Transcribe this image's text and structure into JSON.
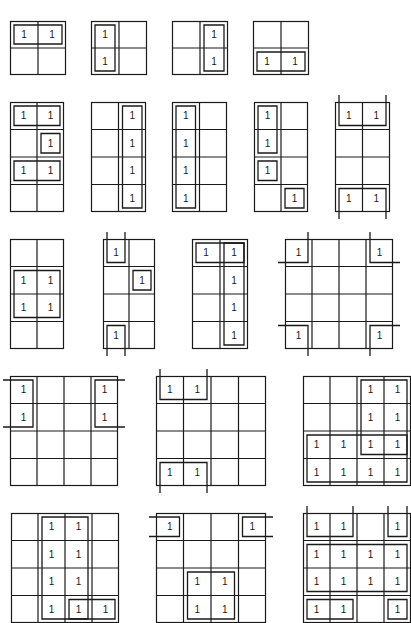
{
  "figure": {
    "cell_value_symbol": "1",
    "line_color": "#1a1a1a"
  },
  "maps": [
    {
      "id": "m1",
      "x": 10,
      "y": 21,
      "cols": 2,
      "rows": 2,
      "cw": 28,
      "ch": 27,
      "ones": [
        [
          0,
          0
        ],
        [
          0,
          1
        ]
      ],
      "loops": [
        {
          "type": "rect",
          "r0": 0,
          "c0": 0,
          "r1": 0,
          "c1": 1
        }
      ]
    },
    {
      "id": "m2",
      "x": 91,
      "y": 21,
      "cols": 2,
      "rows": 2,
      "cw": 28,
      "ch": 27,
      "ones": [
        [
          0,
          0
        ],
        [
          1,
          0
        ]
      ],
      "loops": [
        {
          "type": "rect",
          "r0": 0,
          "c0": 0,
          "r1": 1,
          "c1": 0
        }
      ]
    },
    {
      "id": "m3",
      "x": 172,
      "y": 21,
      "cols": 2,
      "rows": 2,
      "cw": 28,
      "ch": 27,
      "ones": [
        [
          0,
          1
        ],
        [
          1,
          1
        ]
      ],
      "loops": [
        {
          "type": "rect",
          "r0": 0,
          "c0": 1,
          "r1": 1,
          "c1": 1
        }
      ]
    },
    {
      "id": "m4",
      "x": 253,
      "y": 21,
      "cols": 2,
      "rows": 2,
      "cw": 28,
      "ch": 27,
      "ones": [
        [
          1,
          0
        ],
        [
          1,
          1
        ]
      ],
      "loops": [
        {
          "type": "rect",
          "r0": 1,
          "c0": 0,
          "r1": 1,
          "c1": 1
        }
      ]
    },
    {
      "id": "m5",
      "x": 10,
      "y": 102,
      "cols": 2,
      "rows": 4,
      "cw": 27,
      "ch": 27.5,
      "ones": [
        [
          0,
          0
        ],
        [
          0,
          1
        ],
        [
          1,
          1
        ],
        [
          2,
          0
        ],
        [
          2,
          1
        ]
      ],
      "loops": [
        {
          "type": "rect",
          "r0": 0,
          "c0": 0,
          "r1": 0,
          "c1": 1
        },
        {
          "type": "rect",
          "r0": 1,
          "c0": 1,
          "r1": 1,
          "c1": 1
        },
        {
          "type": "rect",
          "r0": 2,
          "c0": 0,
          "r1": 2,
          "c1": 1
        }
      ]
    },
    {
      "id": "m6",
      "x": 91,
      "y": 102,
      "cols": 2,
      "rows": 4,
      "cw": 27.5,
      "ch": 27.5,
      "ones": [
        [
          0,
          1
        ],
        [
          1,
          1
        ],
        [
          2,
          1
        ],
        [
          3,
          1
        ]
      ],
      "loops": [
        {
          "type": "rect",
          "r0": 0,
          "c0": 1,
          "r1": 3,
          "c1": 1
        }
      ]
    },
    {
      "id": "m7",
      "x": 172,
      "y": 102,
      "cols": 2,
      "rows": 4,
      "cw": 27.5,
      "ch": 27.5,
      "ones": [
        [
          0,
          0
        ],
        [
          1,
          0
        ],
        [
          2,
          0
        ],
        [
          3,
          0
        ]
      ],
      "loops": [
        {
          "type": "rect",
          "r0": 0,
          "c0": 0,
          "r1": 3,
          "c1": 0
        }
      ]
    },
    {
      "id": "m8",
      "x": 254,
      "y": 102,
      "cols": 2,
      "rows": 4,
      "cw": 27,
      "ch": 27.5,
      "ones": [
        [
          0,
          0
        ],
        [
          1,
          0
        ],
        [
          2,
          0
        ],
        [
          3,
          1
        ]
      ],
      "loops": [
        {
          "type": "rect",
          "r0": 0,
          "c0": 0,
          "r1": 1,
          "c1": 0
        },
        {
          "type": "rect",
          "r0": 2,
          "c0": 0,
          "r1": 2,
          "c1": 0
        },
        {
          "type": "rect",
          "r0": 3,
          "c0": 1,
          "r1": 3,
          "c1": 1
        }
      ]
    },
    {
      "id": "m9",
      "x": 335,
      "y": 102,
      "cols": 2,
      "rows": 4,
      "cw": 27.5,
      "ch": 27.5,
      "ones": [
        [
          0,
          0
        ],
        [
          0,
          1
        ],
        [
          3,
          0
        ],
        [
          3,
          1
        ]
      ],
      "loops": [
        {
          "type": "open-top-down",
          "r0": 0,
          "c0": 0,
          "r1": 0,
          "c1": 1
        },
        {
          "type": "open-bottom-up",
          "r0": 3,
          "c0": 0,
          "r1": 3,
          "c1": 1
        }
      ]
    },
    {
      "id": "m10",
      "x": 10,
      "y": 239,
      "cols": 2,
      "rows": 4,
      "cw": 27,
      "ch": 27.5,
      "ones": [
        [
          1,
          0
        ],
        [
          1,
          1
        ],
        [
          2,
          0
        ],
        [
          2,
          1
        ]
      ],
      "loops": [
        {
          "type": "rect",
          "r0": 1,
          "c0": 0,
          "r1": 2,
          "c1": 1
        }
      ]
    },
    {
      "id": "m11",
      "x": 103,
      "y": 239,
      "cols": 2,
      "rows": 4,
      "cw": 26,
      "ch": 27.5,
      "ones": [
        [
          0,
          0
        ],
        [
          1,
          1
        ],
        [
          3,
          0
        ]
      ],
      "loops": [
        {
          "type": "open-top-down",
          "r0": 0,
          "c0": 0,
          "r1": 0,
          "c1": 0
        },
        {
          "type": "rect",
          "r0": 1,
          "c0": 1,
          "r1": 1,
          "c1": 1
        },
        {
          "type": "open-bottom-up",
          "r0": 3,
          "c0": 0,
          "r1": 3,
          "c1": 0
        }
      ]
    },
    {
      "id": "m12",
      "x": 192,
      "y": 239,
      "cols": 2,
      "rows": 4,
      "cw": 28,
      "ch": 27.5,
      "ones": [
        [
          0,
          0
        ],
        [
          0,
          1
        ],
        [
          1,
          1
        ],
        [
          2,
          1
        ],
        [
          3,
          1
        ]
      ],
      "loops": [
        {
          "type": "rect",
          "r0": 0,
          "c0": 0,
          "r1": 0,
          "c1": 1
        },
        {
          "type": "rect",
          "r0": 0,
          "c0": 1,
          "r1": 3,
          "c1": 1
        }
      ]
    },
    {
      "id": "m13",
      "x": 285,
      "y": 239,
      "cols": 4,
      "rows": 4,
      "cw": 27,
      "ch": 27.5,
      "ones": [
        [
          0,
          0
        ],
        [
          0,
          3
        ],
        [
          3,
          0
        ],
        [
          3,
          3
        ]
      ],
      "loops": [
        {
          "type": "corner",
          "r": 0,
          "c": 0
        },
        {
          "type": "corner",
          "r": 0,
          "c": 3
        },
        {
          "type": "corner",
          "r": 3,
          "c": 0
        },
        {
          "type": "corner",
          "r": 3,
          "c": 3
        }
      ]
    },
    {
      "id": "m14",
      "x": 10,
      "y": 376,
      "cols": 4,
      "rows": 4,
      "cw": 27,
      "ch": 27.5,
      "ones": [
        [
          0,
          0
        ],
        [
          1,
          0
        ],
        [
          0,
          3
        ],
        [
          1,
          3
        ]
      ],
      "loops": [
        {
          "type": "open-left-right",
          "r0": 0,
          "c0": 0,
          "r1": 1,
          "c1": 0
        },
        {
          "type": "open-right-left",
          "r0": 0,
          "c0": 3,
          "r1": 1,
          "c1": 3
        }
      ]
    },
    {
      "id": "m15",
      "x": 156,
      "y": 376,
      "cols": 4,
      "rows": 4,
      "cw": 27.5,
      "ch": 27.5,
      "ones": [
        [
          0,
          0
        ],
        [
          0,
          1
        ],
        [
          3,
          0
        ],
        [
          3,
          1
        ]
      ],
      "loops": [
        {
          "type": "open-top-down",
          "r0": 0,
          "c0": 0,
          "r1": 0,
          "c1": 1
        },
        {
          "type": "open-bottom-up",
          "r0": 3,
          "c0": 0,
          "r1": 3,
          "c1": 1
        }
      ]
    },
    {
      "id": "m16",
      "x": 303,
      "y": 376,
      "cols": 4,
      "rows": 4,
      "cw": 27,
      "ch": 27.5,
      "ones": [
        [
          0,
          2
        ],
        [
          0,
          3
        ],
        [
          1,
          2
        ],
        [
          1,
          3
        ],
        [
          2,
          0
        ],
        [
          2,
          1
        ],
        [
          2,
          2
        ],
        [
          2,
          3
        ],
        [
          3,
          0
        ],
        [
          3,
          1
        ],
        [
          3,
          2
        ],
        [
          3,
          3
        ]
      ],
      "loops": [
        {
          "type": "rect",
          "r0": 0,
          "c0": 2,
          "r1": 2,
          "c1": 3
        },
        {
          "type": "rect",
          "r0": 2,
          "c0": 0,
          "r1": 3,
          "c1": 3
        }
      ]
    },
    {
      "id": "m17",
      "x": 11,
      "y": 513,
      "cols": 4,
      "rows": 4,
      "cw": 27,
      "ch": 27.5,
      "ones": [
        [
          0,
          1
        ],
        [
          0,
          2
        ],
        [
          1,
          1
        ],
        [
          1,
          2
        ],
        [
          2,
          1
        ],
        [
          2,
          2
        ],
        [
          3,
          1
        ],
        [
          3,
          2
        ],
        [
          3,
          3
        ]
      ],
      "loops": [
        {
          "type": "rect",
          "r0": 0,
          "c0": 1,
          "r1": 3,
          "c1": 2
        },
        {
          "type": "rect",
          "r0": 3,
          "c0": 2,
          "r1": 3,
          "c1": 3
        }
      ]
    },
    {
      "id": "m18",
      "x": 156,
      "y": 513,
      "cols": 4,
      "rows": 4,
      "cw": 27.5,
      "ch": 27.5,
      "ones": [
        [
          0,
          0
        ],
        [
          0,
          3
        ],
        [
          2,
          1
        ],
        [
          2,
          2
        ],
        [
          3,
          1
        ],
        [
          3,
          2
        ]
      ],
      "loops": [
        {
          "type": "open-left-right",
          "r0": 0,
          "c0": 0,
          "r1": 0,
          "c1": 0
        },
        {
          "type": "open-right-left",
          "r0": 0,
          "c0": 3,
          "r1": 0,
          "c1": 3
        },
        {
          "type": "rect",
          "r0": 2,
          "c0": 1,
          "r1": 3,
          "c1": 2
        }
      ]
    },
    {
      "id": "m19",
      "x": 303,
      "y": 513,
      "cols": 4,
      "rows": 4,
      "cw": 27,
      "ch": 27.5,
      "ones": [
        [
          0,
          0
        ],
        [
          0,
          1
        ],
        [
          0,
          3
        ],
        [
          1,
          0
        ],
        [
          1,
          1
        ],
        [
          1,
          2
        ],
        [
          1,
          3
        ],
        [
          2,
          0
        ],
        [
          2,
          1
        ],
        [
          2,
          2
        ],
        [
          2,
          3
        ],
        [
          3,
          0
        ],
        [
          3,
          1
        ],
        [
          3,
          3
        ]
      ],
      "loops": [
        {
          "type": "open-top-down",
          "r0": 0,
          "c0": 0,
          "r1": 0,
          "c1": 1
        },
        {
          "type": "open-top-down",
          "r0": 0,
          "c0": 3,
          "r1": 0,
          "c1": 3
        },
        {
          "type": "rect",
          "r0": 1,
          "c0": 0,
          "r1": 2,
          "c1": 3
        },
        {
          "type": "rect",
          "r0": 3,
          "c0": 0,
          "r1": 3,
          "c1": 1
        },
        {
          "type": "rect",
          "r0": 3,
          "c0": 3,
          "r1": 3,
          "c1": 3
        }
      ]
    }
  ]
}
